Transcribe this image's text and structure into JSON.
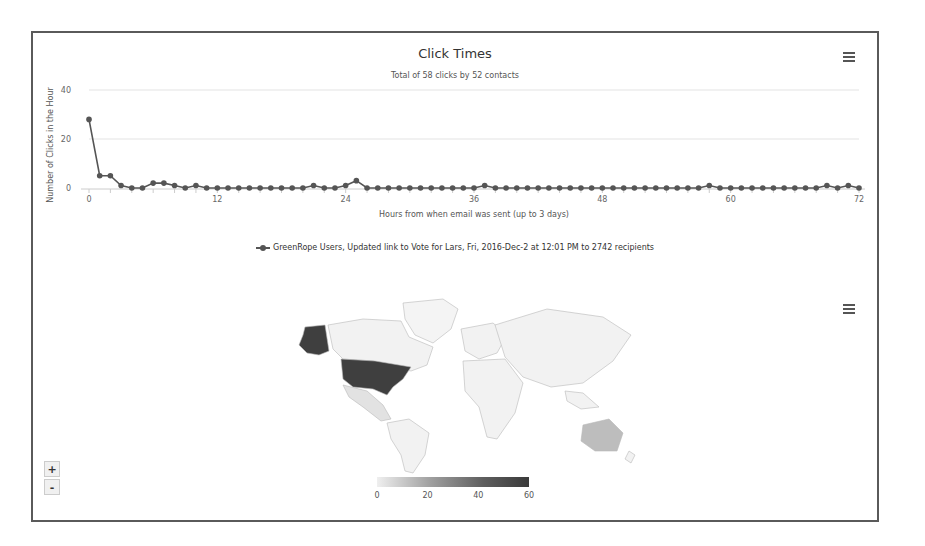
{
  "line_chart": {
    "title": "Click Times",
    "subtitle": "Total of 58 clicks by 52 contacts",
    "menu_icon": "hamburger-menu-icon",
    "legend_label": "GreenRope Users, Updated link to Vote for Lars, Fri, 2016-Dec-2 at 12:01 PM to 2742 recipients"
  },
  "map_chart": {
    "menu_icon": "hamburger-menu-icon",
    "zoom_in_label": "+",
    "zoom_out_label": "-",
    "color_axis": {
      "min": 0,
      "max": 60,
      "ticks": [
        "0",
        "20",
        "40",
        "60"
      ],
      "min_color": "#efefef",
      "max_color": "#3a3a3a"
    },
    "highlighted_regions": [
      {
        "name": "United States",
        "level": "high",
        "color": "#3f3f3f"
      },
      {
        "name": "Australia",
        "level": "low",
        "color": "#bdbdbd"
      },
      {
        "name": "Mexico",
        "level": "low",
        "color": "#d6d6d6"
      }
    ]
  },
  "chart_data": [
    {
      "type": "line",
      "title": "Click Times",
      "subtitle": "Total of 58 clicks by 52 contacts",
      "xlabel": "Hours from when email was sent (up to 3 days)",
      "ylabel": "Number of Clicks in the Hour",
      "xlim": [
        0,
        72
      ],
      "ylim": [
        0,
        40
      ],
      "xticks": [
        0,
        12,
        24,
        36,
        48,
        60,
        72
      ],
      "yticks": [
        0,
        20,
        40
      ],
      "grid": true,
      "legend_position": "bottom",
      "series": [
        {
          "name": "GreenRope Users, Updated link to Vote for Lars, Fri, 2016-Dec-2 at 12:01 PM to 2742 recipients",
          "color": "#555555",
          "x": [
            0,
            1,
            2,
            3,
            4,
            5,
            6,
            7,
            8,
            9,
            10,
            11,
            12,
            13,
            14,
            15,
            16,
            17,
            18,
            19,
            20,
            21,
            22,
            23,
            24,
            25,
            26,
            27,
            28,
            29,
            30,
            31,
            32,
            33,
            34,
            35,
            36,
            37,
            38,
            39,
            40,
            41,
            42,
            43,
            44,
            45,
            46,
            47,
            48,
            49,
            50,
            51,
            52,
            53,
            54,
            55,
            56,
            57,
            58,
            59,
            60,
            61,
            62,
            63,
            64,
            65,
            66,
            67,
            68,
            69,
            70,
            71,
            72
          ],
          "values": [
            28,
            5,
            5,
            1,
            0,
            0,
            2,
            2,
            1,
            0,
            1,
            0,
            0,
            0,
            0,
            0,
            0,
            0,
            0,
            0,
            0,
            1,
            0,
            0,
            1,
            3,
            0,
            0,
            0,
            0,
            0,
            0,
            0,
            0,
            0,
            0,
            0,
            1,
            0,
            0,
            0,
            0,
            0,
            0,
            0,
            0,
            0,
            0,
            0,
            0,
            0,
            0,
            0,
            0,
            0,
            0,
            0,
            0,
            1,
            0,
            0,
            0,
            0,
            0,
            0,
            0,
            0,
            0,
            0,
            1,
            0,
            1,
            0,
            0,
            2
          ]
        }
      ]
    },
    {
      "type": "heatmap",
      "title": "",
      "description": "World choropleth map of clicks by country",
      "color_axis": {
        "min": 0,
        "max": 60,
        "ticks": [
          0,
          20,
          40,
          60
        ]
      },
      "regions": [
        {
          "name": "United States",
          "value": 52
        },
        {
          "name": "Australia",
          "value": 3
        },
        {
          "name": "Mexico",
          "value": 1
        }
      ]
    }
  ]
}
